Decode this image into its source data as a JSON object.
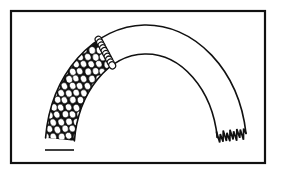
{
  "figure": {
    "kind": "line-art-illustration",
    "caption": "",
    "background_color": "#ffffff",
    "ink_color": "#111111"
  },
  "frame": {
    "name": "illustration-border",
    "x": 11,
    "y": 11,
    "width": 254,
    "height": 152,
    "stroke_color": "#111111",
    "stroke_width": 2.2,
    "fill": "none"
  },
  "arch": {
    "name": "arch-band",
    "center_x": 146,
    "center_y": 151,
    "outer_radius_x": 101,
    "outer_radius_y": 126,
    "inner_radius_x": 72,
    "inner_radius_y": 97,
    "start_angle_deg": 186,
    "end_angle_deg": 352,
    "stroke_color": "#111111",
    "stroke_width": 1.6,
    "fill": "none"
  },
  "textured_zone": {
    "name": "rubble-masonry-fill",
    "description": "left haunch of arch filled with staggered white ovals on black ground",
    "fill_color": "#111111",
    "stone_color": "#ffffff",
    "stone_stroke": "#111111",
    "stone_radius_x": 3.1,
    "stone_radius_y": 3.6,
    "row_spacing": 7.2,
    "column_spacing": 7.6,
    "stagger": true,
    "extent_angle_deg": [
      186,
      242
    ]
  },
  "joint_line": {
    "name": "radial-stone-joint",
    "description": "single radial column of stones marking edge of rendered masonry",
    "angle_deg": 242,
    "stone_count": 9
  },
  "broken_edge": {
    "name": "jagged-break-terminus",
    "description": "rough fractured end of the arch at lower right",
    "angle_deg": 352,
    "zigzag_peaks": 17,
    "amplitude": 6
  },
  "flat_base": {
    "name": "springing-base-cut",
    "description": "flat horizontal cut across the bottom of the left haunch",
    "y": 150
  }
}
